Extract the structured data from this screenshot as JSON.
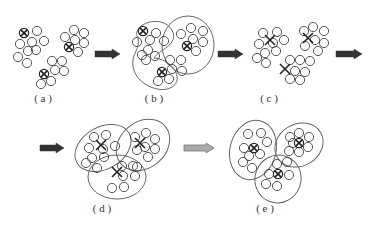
{
  "panels": [
    {
      "id": "a",
      "label": "( a )",
      "label_pos": [
        43,
        99
      ],
      "ellipses": [],
      "centers": [
        {
          "x": 24,
          "y": 33,
          "type": "circled-x"
        },
        {
          "x": 69,
          "y": 47,
          "type": "circled-x"
        },
        {
          "x": 44,
          "y": 74,
          "type": "circled-x"
        }
      ],
      "points": [
        [
          37,
          31
        ],
        [
          44,
          41
        ],
        [
          32,
          42
        ],
        [
          20,
          44
        ],
        [
          28,
          51
        ],
        [
          36,
          50
        ],
        [
          18,
          57
        ],
        [
          27,
          63
        ],
        [
          65,
          37
        ],
        [
          74,
          30
        ],
        [
          84,
          33
        ],
        [
          75,
          40
        ],
        [
          84,
          43
        ],
        [
          78,
          52
        ],
        [
          52,
          61
        ],
        [
          62,
          61
        ],
        [
          55,
          70
        ],
        [
          64,
          71
        ],
        [
          41,
          84
        ],
        [
          51,
          81
        ]
      ]
    },
    {
      "id": "b",
      "label": "( b )",
      "label_pos": [
        154,
        99
      ],
      "ellipses": [
        {
          "type": "path",
          "d": "M138,38 C130,26 160,12 172,30 C180,45 158,50 154,58 C175,60 185,82 170,88 C158,94 130,82 133,60 C134,52 140,48 138,38 Z"
        },
        {
          "type": "circle",
          "cx": 188,
          "cy": 45,
          "rx": 26,
          "ry": 29
        }
      ],
      "centers": [
        {
          "x": 143,
          "y": 31,
          "type": "circled-x"
        },
        {
          "x": 187,
          "y": 46,
          "type": "circled-x"
        },
        {
          "x": 162,
          "y": 72,
          "type": "circled-x"
        }
      ],
      "points": [
        [
          156,
          33
        ],
        [
          137,
          42
        ],
        [
          150,
          40
        ],
        [
          164,
          41
        ],
        [
          148,
          50
        ],
        [
          142,
          55
        ],
        [
          155,
          56
        ],
        [
          146,
          60
        ],
        [
          181,
          34
        ],
        [
          191,
          28
        ],
        [
          203,
          31
        ],
        [
          193,
          39
        ],
        [
          203,
          42
        ],
        [
          196,
          51
        ],
        [
          170,
          60
        ],
        [
          181,
          60
        ],
        [
          172,
          69
        ],
        [
          182,
          71
        ],
        [
          158,
          81
        ],
        [
          169,
          79
        ]
      ]
    },
    {
      "id": "c",
      "label": "( c )",
      "label_pos": [
        269,
        99
      ],
      "ellipses": [],
      "centers": [
        {
          "x": 270,
          "y": 40,
          "type": "x"
        },
        {
          "x": 308,
          "y": 38,
          "type": "x"
        },
        {
          "x": 285,
          "y": 69,
          "type": "x"
        }
      ],
      "points": [
        [
          263,
          33
        ],
        [
          277,
          32
        ],
        [
          259,
          44
        ],
        [
          273,
          43
        ],
        [
          284,
          40
        ],
        [
          265,
          53
        ],
        [
          276,
          51
        ],
        [
          257,
          58
        ],
        [
          266,
          63
        ],
        [
          304,
          31
        ],
        [
          313,
          27
        ],
        [
          324,
          31
        ],
        [
          315,
          40
        ],
        [
          324,
          43
        ],
        [
          318,
          51
        ],
        [
          305,
          46
        ],
        [
          290,
          60
        ],
        [
          300,
          60
        ],
        [
          310,
          61
        ],
        [
          295,
          71
        ],
        [
          305,
          72
        ],
        [
          290,
          79
        ],
        [
          300,
          80
        ]
      ]
    },
    {
      "id": "d",
      "label": "( d )",
      "label_pos": [
        102,
        209
      ],
      "ellipses": [
        {
          "cx": 103,
          "cy": 148,
          "rx": 30,
          "ry": 21,
          "rot": -30
        },
        {
          "cx": 143,
          "cy": 145,
          "rx": 29,
          "ry": 23,
          "rot": -40
        },
        {
          "cx": 117,
          "cy": 177,
          "rx": 29,
          "ry": 22,
          "rot": 0
        }
      ],
      "centers": [
        {
          "x": 101,
          "y": 145,
          "type": "x"
        },
        {
          "x": 140,
          "y": 143,
          "type": "x"
        },
        {
          "x": 117,
          "y": 172,
          "type": "x"
        }
      ],
      "points": [
        [
          94,
          137
        ],
        [
          106,
          135
        ],
        [
          89,
          148
        ],
        [
          103,
          149
        ],
        [
          115,
          146
        ],
        [
          92,
          158
        ],
        [
          104,
          157
        ],
        [
          86,
          163
        ],
        [
          97,
          168
        ],
        [
          135,
          137
        ],
        [
          146,
          133
        ],
        [
          155,
          139
        ],
        [
          145,
          147
        ],
        [
          155,
          149
        ],
        [
          148,
          157
        ],
        [
          137,
          150
        ],
        [
          122,
          166
        ],
        [
          133,
          166
        ],
        [
          123,
          176
        ],
        [
          135,
          176
        ],
        [
          137,
          167
        ],
        [
          112,
          188
        ],
        [
          124,
          187
        ]
      ]
    },
    {
      "id": "e",
      "label": "( e )",
      "label_pos": [
        265,
        209
      ],
      "ellipses": [
        {
          "cx": 253,
          "cy": 150,
          "rx": 23,
          "ry": 30,
          "rot": 15
        },
        {
          "cx": 299,
          "cy": 145,
          "rx": 25,
          "ry": 21,
          "rot": -30
        },
        {
          "cx": 278,
          "cy": 179,
          "rx": 23,
          "ry": 24,
          "rot": 20
        }
      ],
      "centers": [
        {
          "x": 254,
          "y": 148,
          "type": "circled-x"
        },
        {
          "x": 299,
          "y": 143,
          "type": "circled-x"
        },
        {
          "x": 278,
          "y": 174,
          "type": "circled-x"
        }
      ],
      "points": [
        [
          248,
          134
        ],
        [
          261,
          133
        ],
        [
          244,
          148
        ],
        [
          267,
          142
        ],
        [
          249,
          156
        ],
        [
          260,
          154
        ],
        [
          243,
          162
        ],
        [
          252,
          168
        ],
        [
          290,
          137
        ],
        [
          299,
          133
        ],
        [
          309,
          137
        ],
        [
          308,
          147
        ],
        [
          299,
          152
        ],
        [
          289,
          151
        ],
        [
          293,
          143
        ],
        [
          277,
          164
        ],
        [
          287,
          162
        ],
        [
          269,
          174
        ],
        [
          289,
          175
        ],
        [
          266,
          184
        ],
        [
          277,
          186
        ]
      ]
    }
  ],
  "arrows": [
    {
      "id": "a-to-b",
      "x": 95,
      "y": 54,
      "w": 25,
      "style": "dark"
    },
    {
      "id": "b-to-c",
      "x": 218,
      "y": 54,
      "w": 25,
      "style": "dark"
    },
    {
      "id": "c-to-next",
      "x": 336,
      "y": 54,
      "w": 26,
      "style": "dark"
    },
    {
      "id": "into-d",
      "x": 40,
      "y": 148,
      "w": 24,
      "style": "dark"
    },
    {
      "id": "d-to-e",
      "x": 184,
      "y": 148,
      "w": 30,
      "style": "light"
    }
  ],
  "colors": {
    "stroke": "#444444",
    "ellipse": "#666666",
    "arrow_dark": "#333333",
    "arrow_light": "#aaaaaa",
    "arrow_light_stroke": "#777777"
  },
  "point_radius": 4.6
}
